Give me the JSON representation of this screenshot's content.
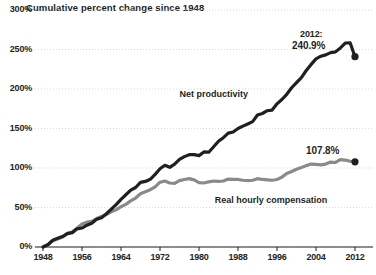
{
  "chart_data": {
    "type": "line",
    "title": "Cumulative percent change since 1948",
    "xlabel": "",
    "ylabel": "",
    "xlim": [
      1948,
      2012
    ],
    "ylim": [
      0,
      300
    ],
    "grid": true,
    "legend_position": "inline-labels",
    "ytick_labels": [
      "300%",
      "250%",
      "200%",
      "150%",
      "100%",
      "50%",
      "0%"
    ],
    "ytick_values": [
      300,
      250,
      200,
      150,
      100,
      50,
      0
    ],
    "xtick_labels": [
      "1948",
      "1956",
      "1964",
      "1972",
      "1980",
      "1988",
      "1996",
      "2004",
      "2012"
    ],
    "xtick_values": [
      1948,
      1956,
      1964,
      1972,
      1980,
      1988,
      1996,
      2004,
      2012
    ],
    "series": [
      {
        "name": "Net productivity",
        "color": "#231f20",
        "label_x": 1992,
        "label_y": 193,
        "endpoint_label": "240.9%",
        "endpoint_year_label": "2012:",
        "end_value": 240.9,
        "x": [
          1948,
          1949,
          1950,
          1951,
          1952,
          1953,
          1954,
          1955,
          1956,
          1957,
          1958,
          1959,
          1960,
          1961,
          1962,
          1963,
          1964,
          1965,
          1966,
          1967,
          1968,
          1969,
          1970,
          1971,
          1972,
          1973,
          1974,
          1975,
          1976,
          1977,
          1978,
          1979,
          1980,
          1981,
          1982,
          1983,
          1984,
          1985,
          1986,
          1987,
          1988,
          1989,
          1990,
          1991,
          1992,
          1993,
          1994,
          1995,
          1996,
          1997,
          1998,
          1999,
          2000,
          2001,
          2002,
          2003,
          2004,
          2005,
          2006,
          2007,
          2008,
          2009,
          2010,
          2011,
          2012
        ],
        "y": [
          0,
          2.8,
          8.5,
          11.0,
          13.2,
          17.0,
          18.2,
          23.0,
          24.0,
          27.6,
          30.0,
          35.0,
          37.1,
          42.2,
          47.8,
          53.6,
          60.3,
          66.1,
          72.0,
          75.3,
          81.8,
          83.0,
          85.7,
          91.9,
          99.0,
          103.5,
          100.9,
          104.8,
          110.9,
          114.4,
          116.9,
          117.0,
          115.7,
          120.3,
          120.0,
          126.9,
          133.8,
          138.4,
          144.1,
          145.6,
          150.0,
          153.0,
          155.8,
          158.7,
          167.0,
          169.0,
          172.5,
          173.3,
          181.2,
          186.7,
          193.3,
          201.6,
          208.1,
          214.5,
          223.4,
          231.1,
          238.1,
          241.5,
          243.2,
          246.0,
          247.0,
          252.0,
          258.0,
          258.5,
          240.9
        ]
      },
      {
        "name": "Real hourly compensation",
        "color": "#8a8a8a",
        "label_x": 1998,
        "label_y": 58,
        "endpoint_label": "107.8%",
        "end_value": 107.8,
        "x": [
          1948,
          1949,
          1950,
          1951,
          1952,
          1953,
          1954,
          1955,
          1956,
          1957,
          1958,
          1959,
          1960,
          1961,
          1962,
          1963,
          1964,
          1965,
          1966,
          1967,
          1968,
          1969,
          1970,
          1971,
          1972,
          1973,
          1974,
          1975,
          1976,
          1977,
          1978,
          1979,
          1980,
          1981,
          1982,
          1983,
          1984,
          1985,
          1986,
          1987,
          1988,
          1989,
          1990,
          1991,
          1992,
          1993,
          1994,
          1995,
          1996,
          1997,
          1998,
          1999,
          2000,
          2001,
          2002,
          2003,
          2004,
          2005,
          2006,
          2007,
          2008,
          2009,
          2010,
          2011,
          2012
        ],
        "y": [
          0,
          3.0,
          8.0,
          10.0,
          12.5,
          17.5,
          19.0,
          24.0,
          29.0,
          31.5,
          32.5,
          36.0,
          38.5,
          41.0,
          44.5,
          47.0,
          51.0,
          54.0,
          58.5,
          62.0,
          67.5,
          70.0,
          72.5,
          76.0,
          82.0,
          83.5,
          81.0,
          80.5,
          84.0,
          85.5,
          86.5,
          85.0,
          81.5,
          81.0,
          82.5,
          83.5,
          83.0,
          83.5,
          86.0,
          85.5,
          85.5,
          84.5,
          84.0,
          84.5,
          86.5,
          85.5,
          85.0,
          84.5,
          85.5,
          88.5,
          93.0,
          95.5,
          98.5,
          100.5,
          103.0,
          105.0,
          104.5,
          104.0,
          105.0,
          107.5,
          107.0,
          110.5,
          110.0,
          108.5,
          107.8
        ]
      }
    ]
  }
}
